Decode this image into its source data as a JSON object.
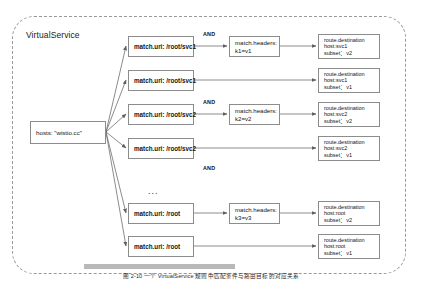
{
  "diagram": {
    "container_label": "VirtualService",
    "hosts_box": {
      "text": "hosts:  \"wistio.cc\""
    },
    "and_label": "AND",
    "ellipsis": "...",
    "caption": "图 2-10 一个 VirtualService 规则中匹配条件与路由目标的对应关系",
    "colors": {
      "container_border": "#9a9a9a",
      "box_border": "#8c8c8c",
      "arrow": "#6f6f6f",
      "text": "#141414",
      "band": "#b9b9b9"
    },
    "rows": [
      {
        "uri": "match.uri: /root/svc1",
        "headers": "match.headers:",
        "headers_kv": "k1=v1",
        "has_and": true,
        "destination_title": "route.destination",
        "destination_host": "host:svc1",
        "destination_subset": "subset：v2"
      },
      {
        "uri": "match.uri: /root/svc1",
        "headers": null,
        "headers_kv": null,
        "has_and": false,
        "destination_title": "route.destination",
        "destination_host": "host:svc1",
        "destination_subset": "subset：v1"
      },
      {
        "uri": "match.uri: /root/svc2",
        "headers": "match.headers:",
        "headers_kv": "k2=v2",
        "has_and": true,
        "destination_title": "route.destination",
        "destination_host": "host:svc2",
        "destination_subset": "subset：v2"
      },
      {
        "uri": "match.uri: /root/svc2",
        "headers": null,
        "headers_kv": null,
        "has_and": false,
        "destination_title": "route.destination",
        "destination_host": "host:svc2",
        "destination_subset": "subset：v1"
      },
      {
        "uri": "match.uri: /root",
        "headers": "match.headers:",
        "headers_kv": "k3=v3",
        "has_and": true,
        "destination_title": "route.destination",
        "destination_host": "host:root",
        "destination_subset": "subset：v2"
      },
      {
        "uri": "match.uri: /root",
        "headers": null,
        "headers_kv": null,
        "has_and": false,
        "destination_title": "route.destination",
        "destination_host": "host:root",
        "destination_subset": "subset：v1"
      }
    ]
  }
}
